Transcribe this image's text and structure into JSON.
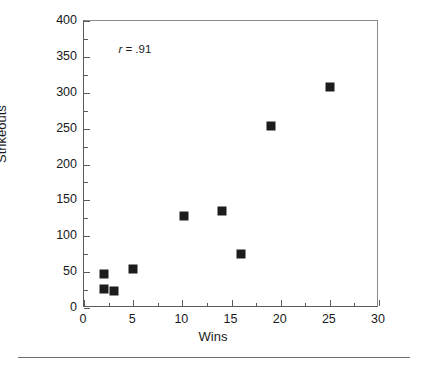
{
  "chart_data": {
    "type": "scatter",
    "title": "",
    "xlabel": "Wins",
    "ylabel": "Strikeouts",
    "xlim": [
      0,
      30
    ],
    "ylim": [
      0,
      400
    ],
    "grid": false,
    "legend": false,
    "annotation": {
      "symbol": "r",
      "text": " = .91",
      "full": "r = .91",
      "x": 3.5,
      "y": 360
    },
    "marker": {
      "shape": "square",
      "color": "#1c1c1c",
      "size_px": 9
    },
    "xticks": [
      0,
      5,
      10,
      15,
      20,
      25,
      30
    ],
    "xtick_labels": [
      "0",
      "5",
      "10",
      "15",
      "20",
      "25",
      "30"
    ],
    "xminor_step": 2.5,
    "yticks": [
      0,
      50,
      100,
      150,
      200,
      250,
      300,
      350,
      400
    ],
    "ytick_labels": [
      "0",
      "50",
      "100",
      "150",
      "200",
      "250",
      "300",
      "350",
      "400"
    ],
    "yminor_step": 25,
    "points": [
      {
        "x": 2,
        "y": 47
      },
      {
        "x": 2,
        "y": 27
      },
      {
        "x": 3,
        "y": 23
      },
      {
        "x": 5,
        "y": 54
      },
      {
        "x": 10.2,
        "y": 128
      },
      {
        "x": 14,
        "y": 135
      },
      {
        "x": 16,
        "y": 75
      },
      {
        "x": 19,
        "y": 253
      },
      {
        "x": 25,
        "y": 308
      }
    ]
  }
}
